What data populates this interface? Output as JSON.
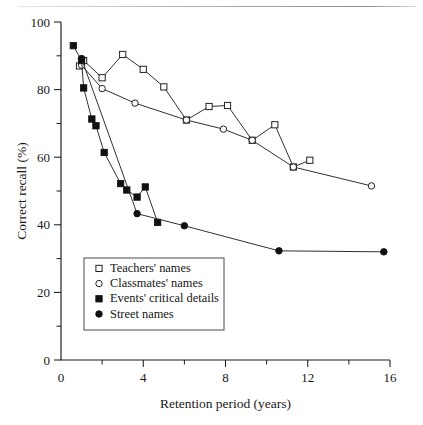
{
  "figure": {
    "background": "#ffffff",
    "ink_color": "#1a1a1a",
    "has_top_rule": true
  },
  "chart_data": {
    "type": "line",
    "title": "",
    "subtitle": "",
    "xlabel": "Retention period (years)",
    "ylabel": "Correct recall (%)",
    "xlim": [
      0,
      16
    ],
    "ylim": [
      0,
      100
    ],
    "xticks": [
      0,
      4,
      8,
      12,
      16
    ],
    "xtick_labels": [
      "0",
      "4",
      "8",
      "12",
      "16"
    ],
    "xminor_ticks": [
      2,
      6,
      10,
      14
    ],
    "yticks": [
      0,
      20,
      40,
      60,
      80,
      100
    ],
    "ytick_labels": [
      "0",
      "20",
      "40",
      "60",
      "80",
      "100"
    ],
    "yminor_ticks": [
      10,
      30,
      50,
      70,
      90
    ],
    "grid": false,
    "legend_position": "lower-left-inset",
    "series": [
      {
        "name": "Teachers' names",
        "marker": "open-square",
        "x": [
          0.9,
          1.1,
          2.0,
          3.0,
          4.0,
          5.0,
          6.1,
          7.2,
          8.1,
          9.3,
          10.4,
          11.3,
          12.1
        ],
        "y": [
          87.0,
          88.6,
          83.5,
          90.4,
          86.0,
          80.8,
          71.0,
          75.0,
          75.3,
          65.0,
          69.6,
          57.1,
          59.1
        ]
      },
      {
        "name": "Classmates' names",
        "marker": "open-circle",
        "x": [
          1.0,
          2.0,
          3.6,
          6.1,
          7.9,
          9.3,
          11.3,
          15.1
        ],
        "y": [
          87.2,
          80.3,
          76.0,
          71.0,
          68.3,
          65.0,
          57.1,
          51.5
        ]
      },
      {
        "name": "Events' critical details",
        "marker": "filled-square",
        "x": [
          0.6,
          1.0,
          1.1,
          1.5,
          1.7,
          2.1,
          2.9,
          3.2,
          3.7,
          4.1,
          4.7
        ],
        "y": [
          93.0,
          88.6,
          80.5,
          71.3,
          69.3,
          61.4,
          52.2,
          50.3,
          48.2,
          51.2,
          40.7
        ]
      },
      {
        "name": "Street names",
        "marker": "filled-circle",
        "x": [
          1.0,
          3.7,
          6.0,
          10.6,
          15.7
        ],
        "y": [
          89.2,
          43.3,
          39.7,
          32.3,
          32.0
        ]
      }
    ],
    "legend": [
      {
        "label": "Teachers' names",
        "marker": "open-square"
      },
      {
        "label": "Classmates' names",
        "marker": "open-circle"
      },
      {
        "label": "Events' critical details",
        "marker": "filled-square"
      },
      {
        "label": "Street names",
        "marker": "filled-circle"
      }
    ]
  }
}
